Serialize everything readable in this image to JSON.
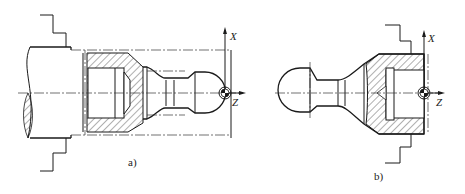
{
  "figure": {
    "panels": [
      {
        "id": "a",
        "caption": "a)",
        "axes": {
          "x_label": "X",
          "z_label": "Z"
        }
      },
      {
        "id": "b",
        "caption": "b)",
        "axes": {
          "x_label": "X",
          "z_label": "Z"
        }
      }
    ]
  },
  "colors": {
    "line": "#1a1a1a",
    "background": "#ffffff"
  }
}
